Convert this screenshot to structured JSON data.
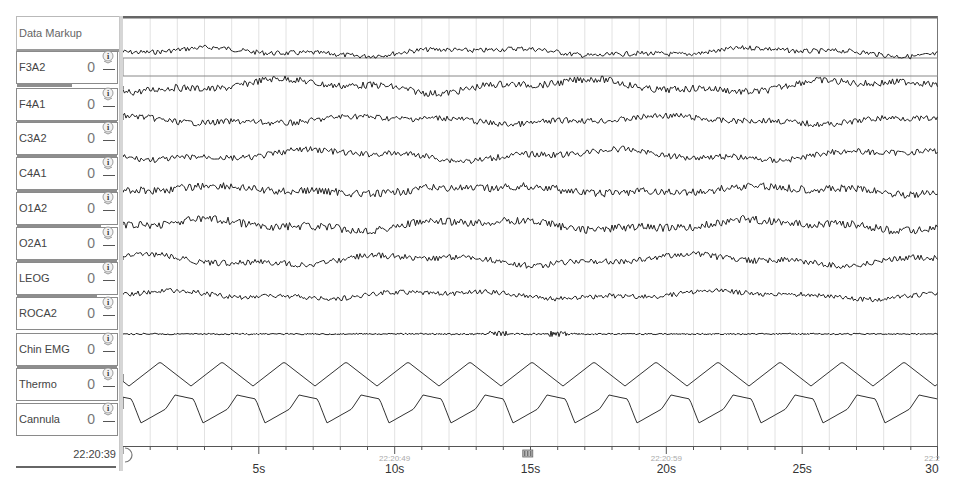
{
  "panel": {
    "markup_label": "Data Markup",
    "channels": [
      {
        "name": "F3A2",
        "value": "0",
        "bar_pct": 55
      },
      {
        "name": "F4A1",
        "value": "0",
        "bar_pct": 100
      },
      {
        "name": "C3A2",
        "value": "0",
        "bar_pct": 100
      },
      {
        "name": "C4A1",
        "value": "0",
        "bar_pct": 100
      },
      {
        "name": "O1A2",
        "value": "0",
        "bar_pct": 84
      },
      {
        "name": "O2A1",
        "value": "0",
        "bar_pct": 100
      },
      {
        "name": "LEOG",
        "value": "0",
        "bar_pct": 80
      },
      {
        "name": "ROCA2",
        "value": "0",
        "bar_pct": 0
      },
      {
        "name": "Chin EMG",
        "value": "0",
        "bar_pct": 100
      },
      {
        "name": "Thermo",
        "value": "0",
        "bar_pct": 0
      },
      {
        "name": "Cannula",
        "value": "0",
        "bar_pct": 0
      }
    ],
    "start_time": "22:20:39"
  },
  "timeline": {
    "duration_s": 30,
    "labels": [
      {
        "sec": 5,
        "text": "5s"
      },
      {
        "sec": 10,
        "text": "10s",
        "time": "22:20:49"
      },
      {
        "sec": 15,
        "text": "15s"
      },
      {
        "sec": 20,
        "text": "20s",
        "time": "22:20:59"
      },
      {
        "sec": 25,
        "text": "25s"
      },
      {
        "sec": 30,
        "text": "30",
        "time": "22:2"
      }
    ],
    "marker_sec": 14.9,
    "marker_icon": "event-marker-icon"
  },
  "colors": {
    "trace": "#222222",
    "grid": "#e2e2e2",
    "border": "#777777"
  }
}
